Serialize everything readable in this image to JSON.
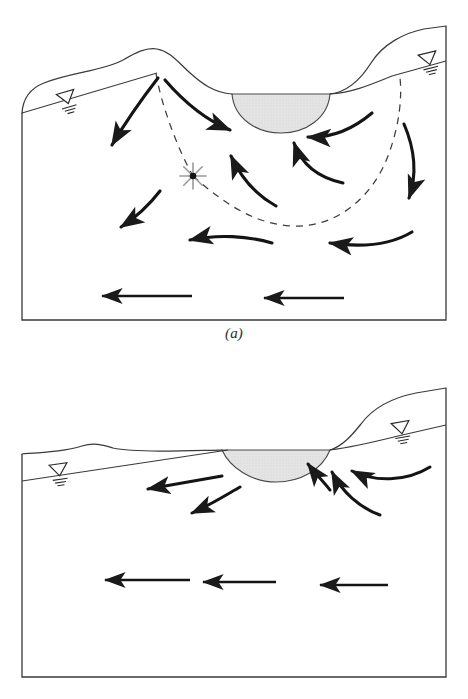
{
  "figure": {
    "domain": "hydrogeology-cross-section",
    "background_color": "#ffffff",
    "line_color": "#1a1a1a",
    "lake_fill_color": "#e2e2e2",
    "dashed_line_color": "#333333",
    "star_color": "#8c8c8c"
  },
  "panels": [
    {
      "id": "a",
      "caption": "(a)",
      "description": "Flow-through / recharge-discharge lake with groundwater divide and stagnation point",
      "box": {
        "x": 22,
        "y": 86,
        "width": 424,
        "height": 234
      },
      "topography": {
        "name": "land-surface-profile",
        "path": "M 22,113 C 24,96 34,86 46,82 C 74,73 104,72 124,61 C 136,54 146,48 156,49 C 168,50 176,60 188,71 C 200,82 214,92 232,94 L 330,94 C 348,92 362,78 372,62 C 384,44 404,34 424,30 L 446,26"
      },
      "water_table": {
        "name": "water-table-line",
        "left_path": "M 22,113 L 156,73",
        "right_path": "M 330,94 C 352,93 372,84 392,76 L 446,62"
      },
      "lake": {
        "name": "lake-water-body",
        "surface_y": 94,
        "left_x": 232,
        "right_x": 330,
        "bottom_y": 133,
        "path": "M 232,94 L 330,94 C 328,118 306,133 281,133 C 256,133 234,118 232,94 Z",
        "fill": "#e2e2e2"
      },
      "water_table_symbols": [
        {
          "name": "water-table-symbol-left",
          "x": 65,
          "y": 98,
          "rotation": -16
        },
        {
          "name": "water-table-symbol-right",
          "x": 427,
          "y": 60,
          "rotation": -14
        }
      ],
      "stagnation_point": {
        "name": "stagnation-point-star",
        "x": 193,
        "y": 176,
        "radius": 13,
        "ray_count": 8,
        "dot_radius": 3.2
      },
      "dashed_boundaries": [
        {
          "name": "groundwater-divide-dashed-left",
          "path": "M 156,73 C 160,100 176,146 193,176"
        },
        {
          "name": "flow-boundary-dashed-lower",
          "path": "M 193,176 C 220,200 252,224 292,226 C 336,228 372,198 388,156 C 400,124 402,96 400,78"
        }
      ],
      "flow_arrows": [
        {
          "name": "flow-arrow-a1",
          "type": "curved",
          "path": "M 158,78 C 144,96 128,118 112,145",
          "note": "left-downward from divide"
        },
        {
          "name": "flow-arrow-a2",
          "type": "curved",
          "path": "M 165,80 C 184,102 206,120 230,130",
          "note": "right toward lake shore"
        },
        {
          "name": "flow-arrow-a3",
          "type": "curved",
          "path": "M 160,191 C 150,204 138,216 121,227",
          "note": "mid-left discharge"
        },
        {
          "name": "flow-arrow-a4",
          "type": "curved",
          "path": "M 276,206 C 258,196 242,180 231,156",
          "note": "upward to lake bed"
        },
        {
          "name": "flow-arrow-a5",
          "type": "curved",
          "path": "M 343,183 C 320,178 302,166 294,143",
          "note": "upward right to lake bed"
        },
        {
          "name": "flow-arrow-a6",
          "type": "curved",
          "path": "M 372,113 C 352,130 330,138 308,137",
          "note": "leftward below right shore"
        },
        {
          "name": "flow-arrow-a7",
          "type": "curved",
          "path": "M 404,124 C 416,152 416,178 409,198",
          "note": "downward on far right"
        },
        {
          "name": "flow-arrow-a8",
          "type": "curved",
          "path": "M 412,232 C 392,244 364,248 330,243",
          "note": "leftward lower right"
        },
        {
          "name": "flow-arrow-a9",
          "type": "curved",
          "path": "M 272,243 C 248,236 218,234 190,240",
          "note": "leftward mid-lower"
        },
        {
          "name": "flow-arrow-a10",
          "type": "straight",
          "path": "M 192,296 L 102,296",
          "note": "regional flow left"
        },
        {
          "name": "flow-arrow-a11",
          "type": "straight",
          "path": "M 344,298 L 264,298",
          "note": "regional flow right"
        }
      ]
    },
    {
      "id": "b",
      "caption": "(b)",
      "description": "Discharge lake receiving groundwater, regional flow continues beneath",
      "box": {
        "x": 22,
        "y": 454,
        "width": 424,
        "height": 223
      },
      "topography": {
        "name": "land-surface-profile",
        "path": "M 22,454 C 50,452 68,450 84,445 C 96,441 104,444 114,447 C 126,450 140,450 160,450 C 192,450 214,450 232,450 L 330,450 C 342,446 352,434 360,424 C 374,406 396,398 416,394 L 446,388"
      },
      "water_table": {
        "name": "water-table-line",
        "left_path": "M 22,480 L 232,450",
        "right_path": "M 330,450 C 352,448 376,442 396,437 L 446,426"
      },
      "lake": {
        "name": "lake-water-body",
        "surface_y": 450,
        "left_x": 222,
        "right_x": 330,
        "bottom_y": 482,
        "path": "M 222,450 L 330,450 C 322,470 300,482 276,482 C 252,482 230,468 222,450 Z",
        "fill": "#e2e2e2"
      },
      "water_table_symbols": [
        {
          "name": "water-table-symbol-left",
          "x": 58,
          "y": 470,
          "rotation": -8
        },
        {
          "name": "water-table-symbol-right",
          "x": 400,
          "y": 430,
          "rotation": -10
        }
      ],
      "flow_arrows": [
        {
          "name": "flow-arrow-b1",
          "type": "straight",
          "path": "M 222,476 L 148,489",
          "note": "leftward from lake left shore"
        },
        {
          "name": "flow-arrow-b2",
          "type": "curved",
          "path": "M 240,487 C 226,495 210,505 192,513",
          "note": "down-left beneath lake"
        },
        {
          "name": "flow-arrow-b3",
          "type": "curved",
          "path": "M 330,490 C 322,480 314,472 308,464",
          "note": "upward to lake right shore"
        },
        {
          "name": "flow-arrow-b4",
          "type": "curved",
          "path": "M 380,515 C 360,508 342,492 332,472",
          "note": "upward right limb"
        },
        {
          "name": "flow-arrow-b5",
          "type": "curved",
          "path": "M 430,467 C 406,482 374,482 352,471",
          "note": "leftward arc upper right"
        },
        {
          "name": "flow-arrow-b6",
          "type": "straight",
          "path": "M 190,580 L 105,580",
          "note": "regional flow left"
        },
        {
          "name": "flow-arrow-b7",
          "type": "straight",
          "path": "M 276,582 L 203,582",
          "note": "regional flow center"
        },
        {
          "name": "flow-arrow-b8",
          "type": "straight",
          "path": "M 388,585 L 320,585",
          "note": "regional flow right"
        }
      ]
    }
  ],
  "legend_symbols": {
    "water_table_symbol": "inverted-triangle-with-hatch-lines",
    "stagnation_point_symbol": "asterisk-star-with-center-dot",
    "flow_line_symbol": "thick-tapered-arrow",
    "boundary_symbol": "dashed-line"
  }
}
